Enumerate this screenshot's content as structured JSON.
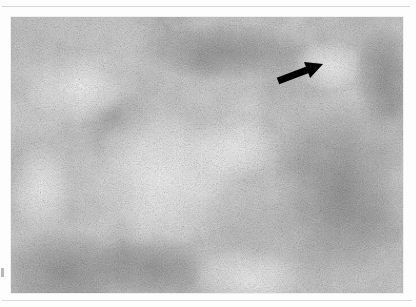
{
  "page": {
    "background_color": "#fdfdfd",
    "rule_color": "#d8d8d8",
    "margin_mark_color": "#b9b9b9"
  },
  "figure": {
    "type": "photomicrograph",
    "modality": "light-microscopy",
    "staining": "grayscale halftone print",
    "magnification_impression": "low-power",
    "tissue_impression": "dense lymphoid tissue with pale rounded nodular foci",
    "frame": {
      "x": 11,
      "y": 17,
      "width": 392,
      "height": 276,
      "border_color": "#efefef",
      "base_tone": "#b5b5b5"
    },
    "tone": {
      "lightest": "#e8e8e8",
      "midtone": "#b0b0b0",
      "darkest": "#5a5a5a"
    },
    "regions": [
      {
        "name": "pale-nodule-upper-right",
        "cx": 318,
        "cy": 48,
        "rx": 34,
        "ry": 27,
        "tone": "light"
      },
      {
        "name": "pale-zone-center-left",
        "cx": 150,
        "cy": 160,
        "rx": 95,
        "ry": 72,
        "tone": "light"
      },
      {
        "name": "pale-nodule-lower-center",
        "cx": 235,
        "cy": 262,
        "rx": 52,
        "ry": 33,
        "tone": "light"
      },
      {
        "name": "pale-zone-upper-left",
        "cx": 70,
        "cy": 70,
        "rx": 58,
        "ry": 38,
        "tone": "light"
      },
      {
        "name": "dark-band-right",
        "cx": 330,
        "cy": 175,
        "rx": 70,
        "ry": 95,
        "tone": "dark"
      },
      {
        "name": "dark-band-upper-center",
        "cx": 215,
        "cy": 35,
        "rx": 85,
        "ry": 30,
        "tone": "dark"
      },
      {
        "name": "dark-band-lower-left",
        "cx": 55,
        "cy": 255,
        "rx": 70,
        "ry": 45,
        "tone": "dark"
      }
    ]
  },
  "annotation": {
    "arrow": {
      "name": "pointer-arrow",
      "color": "#000000",
      "tail_x": 278,
      "tail_y": 81,
      "tip_x": 323,
      "tip_y": 64,
      "shaft_width": 7,
      "head_length": 17,
      "head_width": 17,
      "points_to": "pale-nodule-upper-right"
    }
  }
}
